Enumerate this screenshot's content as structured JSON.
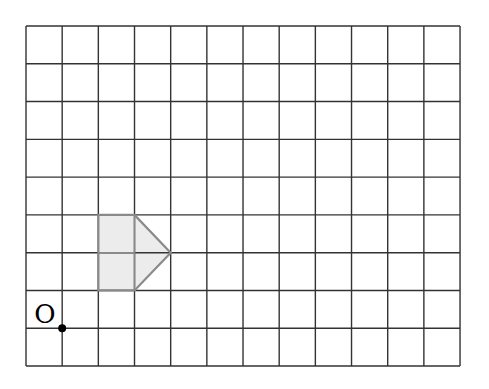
{
  "grid": {
    "columns": 12,
    "rows": 9,
    "origin_px": [
      26,
      26
    ],
    "cell_width": 36.17,
    "cell_height": 37.78,
    "line_color": "#333333"
  },
  "shape": {
    "name": "pentagon-arrow",
    "fill": "#ececec",
    "stroke": "#8a8a8a",
    "vertices_grid": [
      [
        2,
        5
      ],
      [
        3,
        5
      ],
      [
        4,
        6
      ],
      [
        3,
        7
      ],
      [
        2,
        7
      ]
    ],
    "inner_lines_grid": [
      [
        [
          2,
          6
        ],
        [
          3,
          6
        ]
      ],
      [
        [
          3,
          5
        ],
        [
          3,
          7
        ]
      ]
    ]
  },
  "point": {
    "label": "O",
    "grid": [
      1,
      8
    ],
    "color": "#000000"
  }
}
